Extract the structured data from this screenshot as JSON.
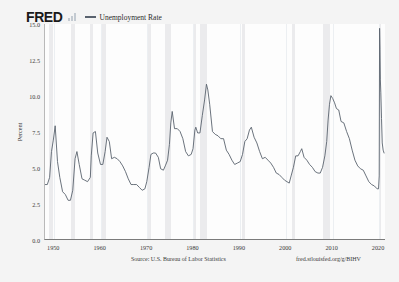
{
  "header": {
    "wordmark": "FRED",
    "logo_icon": "fred-bar-logo-icon",
    "legend_label": "Unemployment Rate",
    "legend_color": "#59626e"
  },
  "footer": {
    "source": "Source: U.S. Bureau of Labor Statistics",
    "shortlink": "fred.stlouisfed.org/g/BIHV"
  },
  "chart_data": {
    "type": "line",
    "title": "Unemployment Rate",
    "xlabel": "",
    "ylabel": "Percent",
    "xlim": [
      1948,
      2021.5
    ],
    "ylim": [
      0.0,
      15.0
    ],
    "grid": true,
    "legend_position": "top",
    "xticks": [
      "1950",
      "1960",
      "1970",
      "1980",
      "1990",
      "2000",
      "2010",
      "2020"
    ],
    "xtick_values": [
      1950,
      1960,
      1970,
      1980,
      1990,
      2000,
      2010,
      2020
    ],
    "yticks": [
      "0.0",
      "2.5",
      "5.0",
      "7.5",
      "10.0",
      "12.5",
      "15.0"
    ],
    "ytick_values": [
      0.0,
      2.5,
      5.0,
      7.5,
      10.0,
      12.5,
      15.0
    ],
    "series": [
      {
        "name": "Unemployment Rate",
        "color": "#59626e",
        "x": [
          1948.0,
          1948.5,
          1949.0,
          1949.4,
          1949.8,
          1950.2,
          1950.7,
          1951.2,
          1951.8,
          1952.4,
          1953.0,
          1953.5,
          1954.0,
          1954.5,
          1954.9,
          1955.4,
          1956.0,
          1956.6,
          1957.2,
          1957.8,
          1958.0,
          1958.4,
          1958.9,
          1959.4,
          1960.0,
          1960.5,
          1961.0,
          1961.4,
          1961.9,
          1962.4,
          1963.0,
          1963.6,
          1964.2,
          1964.8,
          1965.4,
          1966.0,
          1966.6,
          1967.2,
          1967.8,
          1968.4,
          1969.0,
          1969.6,
          1970.0,
          1970.5,
          1970.9,
          1971.4,
          1971.9,
          1972.5,
          1973.0,
          1973.6,
          1974.0,
          1974.5,
          1974.9,
          1975.2,
          1975.5,
          1976.0,
          1976.6,
          1977.2,
          1977.8,
          1978.4,
          1979.0,
          1979.6,
          1980.0,
          1980.4,
          1980.6,
          1981.0,
          1981.5,
          1982.0,
          1982.5,
          1982.9,
          1983.2,
          1983.6,
          1984.2,
          1984.8,
          1985.4,
          1986.0,
          1986.6,
          1987.2,
          1987.8,
          1988.4,
          1989.0,
          1989.6,
          1990.2,
          1990.7,
          1991.2,
          1991.7,
          1992.2,
          1992.6,
          1993.2,
          1993.8,
          1994.4,
          1995.0,
          1995.6,
          1996.2,
          1996.8,
          1997.4,
          1998.0,
          1998.6,
          1999.2,
          1999.8,
          2000.3,
          2000.8,
          2001.2,
          2001.7,
          2002.2,
          2002.7,
          2003.2,
          2003.5,
          2004.0,
          2004.6,
          2005.2,
          2005.8,
          2006.4,
          2007.0,
          2007.5,
          2008.0,
          2008.5,
          2008.9,
          2009.2,
          2009.5,
          2009.8,
          2010.2,
          2010.6,
          2011.0,
          2011.5,
          2012.0,
          2012.6,
          2013.2,
          2013.8,
          2014.4,
          2015.0,
          2015.6,
          2016.2,
          2016.8,
          2017.4,
          2018.0,
          2018.6,
          2019.2,
          2019.8,
          2020.1,
          2020.25,
          2020.33,
          2020.42,
          2020.5,
          2020.6,
          2020.75,
          2020.9,
          2021.1,
          2021.3
        ],
        "values": [
          3.8,
          3.8,
          4.3,
          6.1,
          6.9,
          7.9,
          5.4,
          4.3,
          3.3,
          3.1,
          2.7,
          2.7,
          3.4,
          5.6,
          6.1,
          5.2,
          4.2,
          4.1,
          4.0,
          4.3,
          5.8,
          7.4,
          7.5,
          6.0,
          5.2,
          5.2,
          6.1,
          7.1,
          6.8,
          5.6,
          5.7,
          5.6,
          5.4,
          5.1,
          4.7,
          4.2,
          3.8,
          3.8,
          3.8,
          3.6,
          3.4,
          3.5,
          4.0,
          5.0,
          5.9,
          6.0,
          6.0,
          5.7,
          4.9,
          4.8,
          5.1,
          5.5,
          6.6,
          8.1,
          8.9,
          7.7,
          7.7,
          7.5,
          7.0,
          6.1,
          5.8,
          5.9,
          6.3,
          7.6,
          7.8,
          7.4,
          7.4,
          8.6,
          9.7,
          10.8,
          10.4,
          9.4,
          7.5,
          7.3,
          7.2,
          7.0,
          7.0,
          6.2,
          5.9,
          5.5,
          5.2,
          5.3,
          5.4,
          5.9,
          6.8,
          7.0,
          7.6,
          7.8,
          7.1,
          6.7,
          6.1,
          5.6,
          5.7,
          5.5,
          5.3,
          5.0,
          4.6,
          4.5,
          4.3,
          4.1,
          4.0,
          3.9,
          4.4,
          5.0,
          5.8,
          5.8,
          6.1,
          6.3,
          5.7,
          5.5,
          5.2,
          5.0,
          4.7,
          4.6,
          4.6,
          5.0,
          5.8,
          6.8,
          8.3,
          9.4,
          10.0,
          9.8,
          9.5,
          9.1,
          9.0,
          8.2,
          8.1,
          7.5,
          7.0,
          6.2,
          5.5,
          5.1,
          4.9,
          4.8,
          4.4,
          4.0,
          3.8,
          3.7,
          3.5,
          3.5,
          4.4,
          14.7,
          13.2,
          11.1,
          10.2,
          8.4,
          6.7,
          6.2,
          6.0
        ],
        "peaks": [
          {
            "year": 1950,
            "value": 7.9
          },
          {
            "year": 1954,
            "value": 6.1
          },
          {
            "year": 1958,
            "value": 7.5
          },
          {
            "year": 1961,
            "value": 7.1
          },
          {
            "year": 1975,
            "value": 8.9
          },
          {
            "year": 1982,
            "value": 10.8
          },
          {
            "year": 1992,
            "value": 7.8
          },
          {
            "year": 2009,
            "value": 10.0
          },
          {
            "year": 2020,
            "value": 14.7
          }
        ]
      }
    ],
    "recession_bands": [
      [
        1948.9,
        1949.8
      ],
      [
        1953.5,
        1954.4
      ],
      [
        1957.6,
        1958.3
      ],
      [
        1960.3,
        1961.1
      ],
      [
        1969.9,
        1970.9
      ],
      [
        1973.9,
        1975.2
      ],
      [
        1980.0,
        1980.5
      ],
      [
        1981.5,
        1982.9
      ],
      [
        1990.5,
        1991.2
      ],
      [
        2001.2,
        2001.8
      ],
      [
        2007.9,
        2009.4
      ],
      [
        2020.1,
        2020.4
      ]
    ]
  }
}
